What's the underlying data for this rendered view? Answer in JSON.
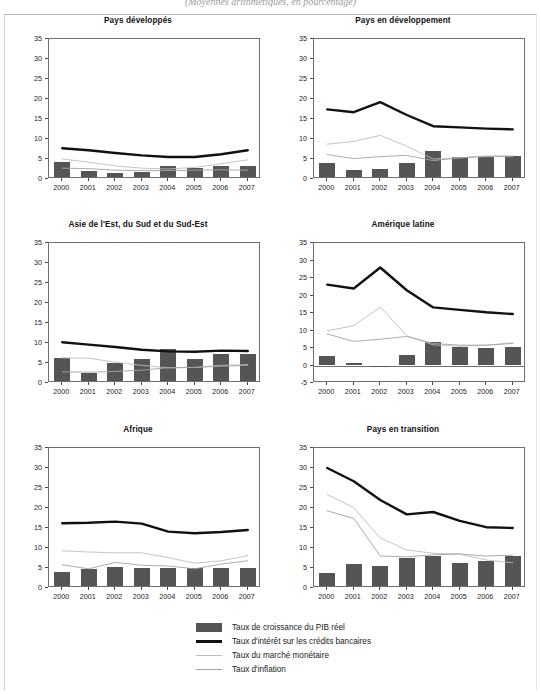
{
  "caption": "(Moyennes arithmétiques, en pourcentage)",
  "legend": {
    "items": [
      {
        "label": "Taux de croissance du PIB réel",
        "swatch": "bar-swatch",
        "color": "#555555"
      },
      {
        "label": "Taux d'intérêt sur les crédits bancaires",
        "swatch": "thick-line-swatch",
        "color": "#111111"
      },
      {
        "label": "Taux du marché monétaire",
        "swatch": "thin-light-line-swatch",
        "color": "#bdbdbd"
      },
      {
        "label": "Taux d'inflation",
        "swatch": "thin-gray-line-swatch",
        "color": "#a3a3a3"
      }
    ]
  },
  "chart_data": [
    {
      "type": "bar",
      "title": "Pays développés",
      "categories": [
        "2000",
        "2001",
        "2002",
        "2003",
        "2004",
        "2005",
        "2006",
        "2007"
      ],
      "xlabel": "",
      "ylabel": "",
      "ylim": [
        0,
        35
      ],
      "yticks": [
        0,
        5,
        10,
        15,
        20,
        25,
        30,
        35
      ],
      "grid": false,
      "legend_position": "bottom-shared",
      "series": [
        {
          "name": "Taux de croissance du PIB réel",
          "type": "bar",
          "color": "#555555",
          "values": [
            4.2,
            2.1,
            1.5,
            1.7,
            3.3,
            2.7,
            3.2,
            3.2
          ]
        },
        {
          "name": "Taux d'intérêt sur les crédits bancaires",
          "type": "line",
          "color": "#111111",
          "values": [
            7.7,
            7.2,
            6.5,
            5.9,
            5.5,
            5.5,
            6.2,
            7.2
          ]
        },
        {
          "name": "Taux du marché monétaire",
          "type": "line",
          "color": "#bdbdbd",
          "values": [
            5.0,
            4.2,
            3.3,
            2.7,
            2.5,
            2.9,
            3.8,
            4.8
          ]
        },
        {
          "name": "Taux d'inflation",
          "type": "line",
          "color": "#a3a3a3",
          "values": [
            2.7,
            2.6,
            2.2,
            2.1,
            2.1,
            2.2,
            2.3,
            2.2
          ]
        }
      ]
    },
    {
      "type": "bar",
      "title": "Pays en développement",
      "categories": [
        "2000",
        "2001",
        "2002",
        "2003",
        "2004",
        "2005",
        "2006",
        "2007"
      ],
      "xlabel": "",
      "ylabel": "",
      "ylim": [
        0,
        35
      ],
      "yticks": [
        0,
        5,
        10,
        15,
        20,
        25,
        30,
        35
      ],
      "grid": false,
      "legend_position": "bottom-shared",
      "series": [
        {
          "name": "Taux de croissance du PIB réel",
          "type": "bar",
          "color": "#555555",
          "values": [
            4.1,
            2.2,
            2.6,
            4.1,
            6.9,
            5.5,
            5.6,
            5.8
          ]
        },
        {
          "name": "Taux d'intérêt sur les crédits bancaires",
          "type": "line",
          "color": "#111111",
          "values": [
            17.4,
            16.7,
            19.2,
            16.0,
            13.2,
            12.9,
            12.6,
            12.4
          ]
        },
        {
          "name": "Taux du marché monétaire",
          "type": "line",
          "color": "#bdbdbd",
          "values": [
            8.7,
            9.4,
            10.9,
            8.2,
            5.0,
            5.3,
            5.8,
            5.8
          ]
        },
        {
          "name": "Taux d'inflation",
          "type": "line",
          "color": "#a3a3a3",
          "values": [
            6.1,
            5.1,
            5.6,
            5.9,
            4.6,
            5.3,
            5.6,
            5.6
          ]
        }
      ]
    },
    {
      "type": "bar",
      "title": "Asie de l'Est, du Sud et du Sud-Est",
      "categories": [
        "2000",
        "2001",
        "2002",
        "2003",
        "2004",
        "2005",
        "2006",
        "2007"
      ],
      "xlabel": "",
      "ylabel": "",
      "ylim": [
        0,
        35
      ],
      "yticks": [
        0,
        5,
        10,
        15,
        20,
        25,
        30,
        35
      ],
      "grid": false,
      "legend_position": "bottom-shared",
      "series": [
        {
          "name": "Taux de croissance du PIB réel",
          "type": "bar",
          "color": "#555555",
          "values": [
            6.2,
            2.6,
            5.1,
            5.9,
            8.5,
            6.0,
            7.2,
            7.3
          ]
        },
        {
          "name": "Taux d'intérêt sur les crédits bancaires",
          "type": "line",
          "color": "#111111",
          "values": [
            10.2,
            9.6,
            9.0,
            8.3,
            7.9,
            7.8,
            8.1,
            8.0
          ]
        },
        {
          "name": "Taux du marché monétaire",
          "type": "line",
          "color": "#bdbdbd",
          "values": [
            6.3,
            6.2,
            5.2,
            4.4,
            3.8,
            3.9,
            4.4,
            4.6
          ]
        },
        {
          "name": "Taux d'inflation",
          "type": "line",
          "color": "#a3a3a3",
          "values": [
            2.8,
            2.7,
            2.9,
            3.2,
            3.8,
            3.9,
            4.2,
            4.4
          ]
        }
      ]
    },
    {
      "type": "bar",
      "title": "Amérique latine",
      "categories": [
        "2000",
        "2001",
        "2002",
        "2003",
        "2004",
        "2005",
        "2006",
        "2007"
      ],
      "xlabel": "",
      "ylabel": "",
      "ylim": [
        -5,
        35
      ],
      "yticks": [
        -5,
        0,
        5,
        10,
        15,
        20,
        25,
        30,
        35
      ],
      "grid": false,
      "legend_position": "bottom-shared",
      "series": [
        {
          "name": "Taux de croissance du PIB réel",
          "type": "bar",
          "color": "#555555",
          "values": [
            2.8,
            0.8,
            -0.3,
            2.9,
            6.6,
            5.3,
            5.1,
            5.3
          ]
        },
        {
          "name": "Taux d'intérêt sur les crédits bancaires",
          "type": "line",
          "color": "#111111",
          "values": [
            23.1,
            22.0,
            28.0,
            21.5,
            16.6,
            15.9,
            15.2,
            14.7
          ]
        },
        {
          "name": "Taux du marché monétaire",
          "type": "line",
          "color": "#bdbdbd",
          "values": [
            9.9,
            11.4,
            16.7,
            8.5,
            5.9,
            5.5,
            5.8,
            6.5
          ]
        },
        {
          "name": "Taux d'inflation",
          "type": "line",
          "color": "#a3a3a3",
          "values": [
            9.0,
            6.9,
            7.5,
            8.3,
            6.3,
            5.8,
            5.8,
            6.3
          ]
        }
      ]
    },
    {
      "type": "bar",
      "title": "Afrique",
      "categories": [
        "2000",
        "2001",
        "2002",
        "2003",
        "2004",
        "2005",
        "2006",
        "2007"
      ],
      "xlabel": "",
      "ylabel": "",
      "ylim": [
        0,
        35
      ],
      "yticks": [
        0,
        5,
        10,
        15,
        20,
        25,
        30,
        35
      ],
      "grid": false,
      "legend_position": "bottom-shared",
      "series": [
        {
          "name": "Taux de croissance du PIB réel",
          "type": "bar",
          "color": "#555555",
          "values": [
            4.0,
            4.8,
            5.3,
            4.9,
            5.1,
            5.1,
            4.9,
            5.1
          ]
        },
        {
          "name": "Taux d'intérêt sur les crédits bancaires",
          "type": "line",
          "color": "#111111",
          "values": [
            16.2,
            16.3,
            16.6,
            16.1,
            14.1,
            13.7,
            14.0,
            14.5
          ]
        },
        {
          "name": "Taux du marché monétaire",
          "type": "line",
          "color": "#bdbdbd",
          "values": [
            9.3,
            9.0,
            8.8,
            8.8,
            7.6,
            6.2,
            6.8,
            8.1
          ]
        },
        {
          "name": "Taux d'inflation",
          "type": "line",
          "color": "#a3a3a3",
          "values": [
            5.8,
            4.8,
            6.4,
            5.7,
            5.5,
            4.8,
            6.0,
            6.8
          ]
        }
      ]
    },
    {
      "type": "bar",
      "title": "Pays en transition",
      "categories": [
        "2000",
        "2001",
        "2002",
        "2003",
        "2004",
        "2005",
        "2006",
        "2007"
      ],
      "xlabel": "",
      "ylabel": "",
      "ylim": [
        0,
        35
      ],
      "yticks": [
        0,
        5,
        10,
        15,
        20,
        25,
        30,
        35
      ],
      "grid": false,
      "legend_position": "bottom-shared",
      "series": [
        {
          "name": "Taux de croissance du PIB réel",
          "type": "bar",
          "color": "#555555",
          "values": [
            3.7,
            6.1,
            5.6,
            7.5,
            8.1,
            6.2,
            6.7,
            8.1
          ]
        },
        {
          "name": "Taux d'intérêt sur les crédits bancaires",
          "type": "line",
          "color": "#111111",
          "values": [
            30.0,
            26.7,
            22.0,
            18.4,
            19.0,
            16.8,
            15.2,
            15.0
          ]
        },
        {
          "name": "Taux du marché monétaire",
          "type": "line",
          "color": "#bdbdbd",
          "values": [
            23.4,
            20.1,
            12.5,
            9.5,
            8.7,
            8.5,
            7.0,
            6.3
          ]
        },
        {
          "name": "Taux d'inflation",
          "type": "line",
          "color": "#a3a3a3",
          "values": [
            19.3,
            17.4,
            8.0,
            7.8,
            8.3,
            8.5,
            8.0,
            8.2
          ]
        }
      ]
    }
  ]
}
